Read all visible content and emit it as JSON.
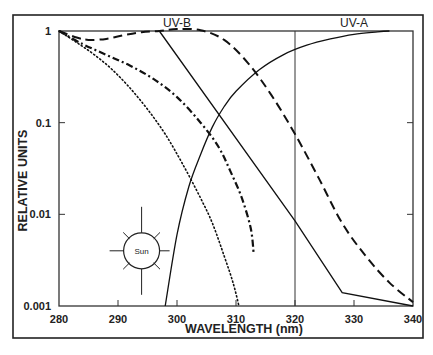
{
  "chart_data": {
    "type": "line",
    "title": "",
    "xlabel": "WAVELENGTH (nm)",
    "ylabel": "RELATIVE UNITS",
    "xlim": [
      280,
      340
    ],
    "ylim": [
      0.001,
      1
    ],
    "yscale": "log",
    "grid": false,
    "x_ticks": [
      280,
      290,
      300,
      310,
      320,
      330,
      340
    ],
    "x_tick_labels": [
      "280",
      "290",
      "300",
      "310",
      "320",
      "330",
      "340"
    ],
    "y_ticks": [
      1,
      0.1,
      0.01,
      0.001
    ],
    "y_tick_labels": [
      "1",
      "0.1",
      "0.01",
      "0.001"
    ],
    "annotations": [
      {
        "text": "UV-B",
        "x": 300,
        "y": 1.2
      },
      {
        "text": "UV-A",
        "x": 330,
        "y": 1.2
      },
      {
        "text": "Sun",
        "x": 294,
        "y": 0.004,
        "kind": "sun-symbol"
      }
    ],
    "vertical_lines": [
      {
        "x": 320,
        "label": "UV-B / UV-A boundary"
      }
    ],
    "series": [
      {
        "name": "solid-straight",
        "style": "solid",
        "x": [
          297,
          320,
          328,
          340
        ],
        "y": [
          1.0,
          0.0085,
          0.0014,
          0.001
        ]
      },
      {
        "name": "solid-rising",
        "style": "solid",
        "x": [
          298,
          300,
          302,
          304,
          306,
          308,
          310,
          314,
          318,
          322,
          326,
          330,
          334,
          336
        ],
        "y": [
          0.001,
          0.006,
          0.02,
          0.045,
          0.09,
          0.15,
          0.22,
          0.38,
          0.55,
          0.7,
          0.82,
          0.92,
          0.98,
          1.0
        ]
      },
      {
        "name": "long-dash",
        "style": "dashed",
        "x": [
          280,
          283,
          285,
          288,
          291,
          294,
          297,
          300,
          304,
          308,
          312,
          316,
          320,
          324,
          328,
          332,
          336,
          340
        ],
        "y": [
          1.0,
          0.85,
          0.8,
          0.82,
          0.9,
          0.97,
          1.0,
          1.05,
          1.02,
          0.8,
          0.45,
          0.2,
          0.075,
          0.025,
          0.008,
          0.0035,
          0.0018,
          0.0011
        ]
      },
      {
        "name": "dash-dot",
        "style": "dashdot",
        "x": [
          280,
          284,
          288,
          292,
          296,
          300,
          304,
          307,
          309,
          311,
          312.5,
          313
        ],
        "y": [
          1.0,
          0.72,
          0.55,
          0.42,
          0.3,
          0.19,
          0.1,
          0.055,
          0.03,
          0.015,
          0.007,
          0.0037
        ]
      },
      {
        "name": "dotted",
        "style": "dotted",
        "x": [
          280,
          283,
          286,
          289,
          292,
          295,
          298,
          301,
          304,
          306,
          308,
          309.5,
          310.5
        ],
        "y": [
          1.0,
          0.75,
          0.55,
          0.38,
          0.24,
          0.14,
          0.075,
          0.035,
          0.015,
          0.008,
          0.0035,
          0.0018,
          0.001
        ]
      }
    ]
  },
  "layout": {
    "plot_left": 59,
    "plot_right": 413,
    "plot_top": 31,
    "plot_bottom": 306,
    "frame": {
      "left": 13,
      "top": 15,
      "right": 423,
      "bottom": 338
    }
  }
}
